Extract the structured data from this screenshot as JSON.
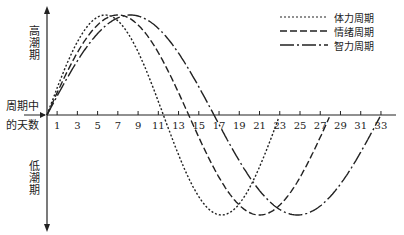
{
  "chart_data": {
    "type": "line",
    "title": "",
    "xlabel": "周期中的天数",
    "ylabel_top": "高潮期",
    "ylabel_bottom": "低潮期",
    "x_ticks": [
      1,
      3,
      5,
      7,
      9,
      11,
      13,
      15,
      17,
      19,
      21,
      23,
      25,
      27,
      29,
      31,
      33
    ],
    "xlim": [
      0,
      34
    ],
    "ylim": [
      -1,
      1
    ],
    "grid": false,
    "legend_position": "top-right",
    "series": [
      {
        "name": "体力周期",
        "style": "dotted",
        "period_days": 23,
        "peak_day": 5.75,
        "trough_day": 17.25,
        "zero_crossing_day": 11.5
      },
      {
        "name": "情绪周期",
        "style": "dashed",
        "period_days": 28,
        "peak_day": 7,
        "trough_day": 21,
        "zero_crossing_day": 14
      },
      {
        "name": "智力周期",
        "style": "dash-dot",
        "period_days": 33,
        "peak_day": 8.25,
        "trough_day": 24.75,
        "zero_crossing_day": 16.5
      }
    ]
  },
  "labels": {
    "high": "高潮期",
    "low": "低潮期",
    "xaxis_line1": "周期中",
    "xaxis_line2": "的天数"
  },
  "legend": [
    {
      "label": "体力周期"
    },
    {
      "label": "情绪周期"
    },
    {
      "label": "智力周期"
    }
  ]
}
